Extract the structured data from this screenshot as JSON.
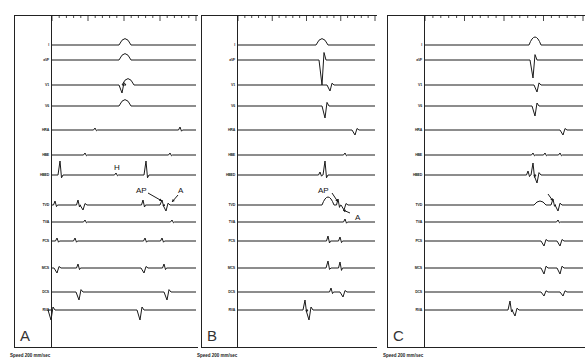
{
  "figure": {
    "footer_speed": "Speed  200 mm/sec",
    "lead_labels": [
      "I",
      "aVF",
      "V1",
      "V6",
      "HRA",
      "HBE",
      "HBED",
      "TVD",
      "TVA",
      "PCS",
      "MCS",
      "DCS",
      "RVA"
    ],
    "lead_y": [
      45,
      60,
      85,
      106,
      130,
      155,
      175,
      205,
      222,
      241,
      268,
      292,
      310
    ],
    "colors": {
      "ink": "#1a1a1a",
      "background": "#ffffff"
    },
    "time_marker_ticks": 20
  },
  "panels": [
    {
      "id": "A",
      "letter": "A",
      "frame_left": 14,
      "frame_width": 184,
      "label_col_width": 37,
      "annotations": [
        {
          "text": "H",
          "x": 114,
          "y": 163
        },
        {
          "text": "AP",
          "x": 136,
          "y": 186
        },
        {
          "text": "A",
          "x": 178,
          "y": 186
        }
      ],
      "arrows": [
        {
          "x1": 148,
          "y1": 193,
          "x2": 162,
          "y2": 201
        },
        {
          "x1": 178,
          "y1": 195,
          "x2": 172,
          "y2": 202
        }
      ],
      "events": {
        "I": [
          [
            125,
            "bump",
            8
          ]
        ],
        "aVF": [
          [
            125,
            "bump",
            8
          ]
        ],
        "V1": [
          [
            122,
            "dip",
            8
          ],
          [
            128,
            "bump",
            8
          ]
        ],
        "V6": [
          [
            125,
            "bump",
            8
          ]
        ],
        "HRA": [
          [
            95,
            "tick",
            2
          ],
          [
            180,
            "tick",
            3
          ]
        ],
        "HBE": [
          [
            85,
            "tick",
            2
          ],
          [
            170,
            "tick",
            2
          ]
        ],
        "HBED": [
          [
            60,
            "spike",
            14
          ],
          [
            146,
            "spike",
            14
          ],
          [
            116,
            "tick",
            2
          ]
        ],
        "TVD": [
          [
            55,
            "tick",
            4
          ],
          [
            78,
            "tick",
            5
          ],
          [
            83,
            "dip",
            5
          ],
          [
            143,
            "tick",
            5
          ],
          [
            162,
            "spike",
            5
          ],
          [
            166,
            "dip",
            6
          ]
        ],
        "TVA": [
          [
            85,
            "tick",
            2
          ],
          [
            172,
            "tick",
            2
          ]
        ],
        "PCS": [
          [
            57,
            "tick",
            3
          ],
          [
            75,
            "tick",
            3
          ],
          [
            145,
            "tick",
            3
          ],
          [
            162,
            "tick",
            3
          ]
        ],
        "MCS": [
          [
            57,
            "dip",
            5
          ],
          [
            78,
            "tick",
            4
          ],
          [
            144,
            "dip",
            5
          ],
          [
            164,
            "tick",
            4
          ]
        ],
        "DCS": [
          [
            79,
            "dip",
            8
          ],
          [
            167,
            "dip",
            8
          ]
        ],
        "RVA": [
          [
            51,
            "dip",
            10
          ],
          [
            140,
            "dip",
            10
          ]
        ]
      }
    },
    {
      "id": "B",
      "letter": "B",
      "frame_left": 201,
      "frame_width": 176,
      "label_col_width": 36,
      "annotations": [
        {
          "text": "AP",
          "x": 318,
          "y": 186
        },
        {
          "text": "A",
          "x": 355,
          "y": 213
        }
      ],
      "arrows": [
        {
          "x1": 332,
          "y1": 193,
          "x2": 338,
          "y2": 202
        },
        {
          "x1": 350,
          "y1": 213,
          "x2": 343,
          "y2": 210
        }
      ],
      "events": {
        "I": [
          [
            322,
            "bump",
            8
          ]
        ],
        "aVF": [
          [
            322,
            "dip",
            25
          ]
        ],
        "V1": [
          [
            330,
            "dip",
            6
          ]
        ],
        "V6": [
          [
            325,
            "dip",
            12
          ]
        ],
        "HRA": [
          [
            355,
            "dip",
            5
          ]
        ],
        "HBE": [
          [
            345,
            "tick",
            2
          ]
        ],
        "HBED": [
          [
            320,
            "tick",
            3
          ],
          [
            325,
            "spike",
            14
          ]
        ],
        "TVD": [
          [
            328,
            "bump",
            10
          ],
          [
            338,
            "tick",
            6
          ],
          [
            344,
            "dip",
            5
          ]
        ],
        "TVA": [
          [
            345,
            "tick",
            3
          ]
        ],
        "PCS": [
          [
            328,
            "tick",
            5
          ],
          [
            340,
            "tick",
            4
          ]
        ],
        "MCS": [
          [
            328,
            "spike",
            7
          ],
          [
            340,
            "tick",
            6
          ]
        ],
        "DCS": [
          [
            331,
            "tick",
            4
          ],
          [
            343,
            "dip",
            5
          ]
        ],
        "RVA": [
          [
            305,
            "spike",
            10
          ],
          [
            309,
            "dip",
            10
          ]
        ]
      }
    },
    {
      "id": "C",
      "letter": "C",
      "frame_left": 387,
      "frame_width": 198,
      "label_col_width": 37,
      "annotations": [],
      "arrows": [
        {
          "x1": 548,
          "y1": 194,
          "x2": 553,
          "y2": 201
        }
      ],
      "events": {
        "I": [
          [
            535,
            "bump",
            10
          ]
        ],
        "aVF": [
          [
            533,
            "dip",
            18
          ]
        ],
        "V1": [
          [
            537,
            "dip",
            7
          ]
        ],
        "V6": [
          [
            535,
            "dip",
            10
          ]
        ],
        "HRA": [
          [
            563,
            "dip",
            5
          ]
        ],
        "HBE": [
          [
            533,
            "tick",
            2
          ],
          [
            545,
            "tick",
            2
          ],
          [
            560,
            "tick",
            2
          ]
        ],
        "HBED": [
          [
            528,
            "tick",
            4
          ],
          [
            533,
            "spike",
            12
          ],
          [
            537,
            "dip",
            8
          ]
        ],
        "TVD": [
          [
            540,
            "bump",
            5
          ],
          [
            553,
            "spike",
            6
          ],
          [
            558,
            "dip",
            6
          ]
        ],
        "TVA": [
          [
            558,
            "tick",
            2
          ]
        ],
        "PCS": [
          [
            544,
            "dip",
            5
          ],
          [
            560,
            "dip",
            5
          ]
        ],
        "MCS": [
          [
            544,
            "dip",
            6
          ],
          [
            560,
            "dip",
            6
          ]
        ],
        "DCS": [
          [
            544,
            "dip",
            4
          ],
          [
            563,
            "dip",
            4
          ]
        ],
        "RVA": [
          [
            510,
            "spike",
            9
          ],
          [
            515,
            "dip",
            6
          ]
        ]
      }
    }
  ]
}
